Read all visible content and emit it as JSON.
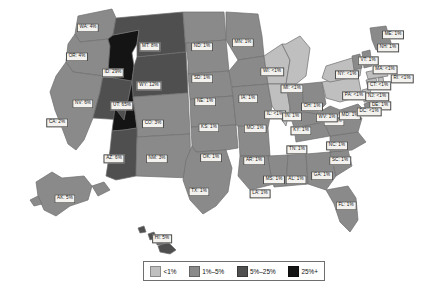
{
  "figure": {
    "type": "choropleth-map",
    "region": "United States",
    "background_color": "#ffffff"
  },
  "legend": {
    "name": "percent-range-legend",
    "position": "bottom-center",
    "entries": [
      {
        "label": "<1%",
        "color": "#bfbfbf"
      },
      {
        "label": "1%–5%",
        "color": "#8a8a8a"
      },
      {
        "label": "5%–25%",
        "color": "#4f4f4f"
      },
      {
        "label": "25%+",
        "color": "#141414"
      }
    ]
  },
  "colors": {
    "tier_lt1": "#bfbfbf",
    "tier_1_5": "#8a8a8a",
    "tier_5_25": "#4f4f4f",
    "tier_25plus": "#141414",
    "border": "#6e6e6e",
    "label_bg": "#f3f2ef",
    "label_border": "#4a4a4a",
    "label_text": "#141414"
  },
  "chart_data": {
    "type": "map",
    "title": "",
    "xlabel": "",
    "ylabel": "",
    "value_unit": "percent",
    "legend_position": "bottom-center",
    "bins": [
      "<1%",
      "1%–5%",
      "5%–25%",
      "25%+"
    ],
    "categories": [
      "WA",
      "OR",
      "CA",
      "NV",
      "ID",
      "MT",
      "WY",
      "UT",
      "CO",
      "AZ",
      "NM",
      "ND",
      "SD",
      "NE",
      "KS",
      "OK",
      "TX",
      "MN",
      "IA",
      "MO",
      "AR",
      "LA",
      "WI",
      "IL",
      "MI",
      "IN",
      "OH",
      "KY",
      "TN",
      "MS",
      "AL",
      "GA",
      "FL",
      "SC",
      "NC",
      "VA",
      "WV",
      "MD",
      "DE",
      "DC",
      "PA",
      "NJ",
      "NY",
      "CT",
      "RI",
      "MA",
      "VT",
      "NH",
      "ME",
      "AK",
      "HI"
    ],
    "values": [
      4,
      4,
      2,
      6,
      29,
      8,
      12,
      65,
      3,
      6,
      3,
      1,
      1,
      1,
      1,
      1,
      1,
      1,
      1,
      1,
      1,
      1,
      0.5,
      0.5,
      0.5,
      1,
      1,
      1,
      1,
      1,
      1,
      1,
      1,
      1,
      1,
      1,
      1,
      1,
      1,
      0.5,
      0.5,
      0.5,
      0.5,
      0.5,
      0.5,
      0.5,
      1,
      1,
      1,
      5,
      5
    ],
    "states": [
      {
        "code": "WA",
        "label": "WA: 4%",
        "value": 4,
        "tier": "tier_1_5",
        "lx": 88,
        "ly": 28
      },
      {
        "code": "OR",
        "label": "OR: 4%",
        "value": 4,
        "tier": "tier_1_5",
        "lx": 77,
        "ly": 57
      },
      {
        "code": "CA",
        "label": "CA: 2%",
        "value": 2,
        "tier": "tier_1_5",
        "lx": 57,
        "ly": 123
      },
      {
        "code": "NV",
        "label": "NV: 6%",
        "value": 6,
        "tier": "tier_5_25",
        "lx": 83,
        "ly": 104
      },
      {
        "code": "ID",
        "label": "ID: 29%",
        "value": 29,
        "tier": "tier_25plus",
        "lx": 113,
        "ly": 73
      },
      {
        "code": "MT",
        "label": "MT: 8%",
        "value": 8,
        "tier": "tier_5_25",
        "lx": 150,
        "ly": 47
      },
      {
        "code": "WY",
        "label": "WY: 12%",
        "value": 12,
        "tier": "tier_5_25",
        "lx": 149,
        "ly": 86
      },
      {
        "code": "UT",
        "label": "UT: 65%",
        "value": 65,
        "tier": "tier_25plus",
        "lx": 122,
        "ly": 106
      },
      {
        "code": "CO",
        "label": "CO: 3%",
        "value": 3,
        "tier": "tier_1_5",
        "lx": 153,
        "ly": 124
      },
      {
        "code": "AZ",
        "label": "AZ: 6%",
        "value": 6,
        "tier": "tier_5_25",
        "lx": 114,
        "ly": 159
      },
      {
        "code": "NM",
        "label": "NM: 3%",
        "value": 3,
        "tier": "tier_1_5",
        "lx": 157,
        "ly": 159
      },
      {
        "code": "ND",
        "label": "ND: 1%",
        "value": 1,
        "tier": "tier_1_5",
        "lx": 202,
        "ly": 47
      },
      {
        "code": "SD",
        "label": "SD: 1%",
        "value": 1,
        "tier": "tier_1_5",
        "lx": 202,
        "ly": 79
      },
      {
        "code": "NE",
        "label": "NE: 1%",
        "value": 1,
        "tier": "tier_1_5",
        "lx": 205,
        "ly": 102
      },
      {
        "code": "KS",
        "label": "KS: 1%",
        "value": 1,
        "tier": "tier_1_5",
        "lx": 209,
        "ly": 128
      },
      {
        "code": "OK",
        "label": "OK: 1%",
        "value": 1,
        "tier": "tier_1_5",
        "lx": 211,
        "ly": 158
      },
      {
        "code": "TX",
        "label": "TX: 1%",
        "value": 1,
        "tier": "tier_1_5",
        "lx": 199,
        "ly": 192
      },
      {
        "code": "MN",
        "label": "MN: 1%",
        "value": 1,
        "tier": "tier_1_5",
        "lx": 243,
        "ly": 43
      },
      {
        "code": "IA",
        "label": "IA: 1%",
        "value": 1,
        "tier": "tier_1_5",
        "lx": 248,
        "ly": 99
      },
      {
        "code": "MO",
        "label": "MO: 1%",
        "value": 1,
        "tier": "tier_1_5",
        "lx": 255,
        "ly": 129
      },
      {
        "code": "AR",
        "label": "AR: 1%",
        "value": 1,
        "tier": "tier_1_5",
        "lx": 254,
        "ly": 161
      },
      {
        "code": "LA",
        "label": "LA: 1%",
        "value": 1,
        "tier": "tier_1_5",
        "lx": 260,
        "ly": 194
      },
      {
        "code": "WI",
        "label": "WI: <1%",
        "value": 0.5,
        "tier": "tier_lt1",
        "lx": 272,
        "ly": 72
      },
      {
        "code": "IL",
        "label": "IL: <1%",
        "value": 0.5,
        "tier": "tier_lt1",
        "lx": 275,
        "ly": 115
      },
      {
        "code": "MI",
        "label": "MI: <1%",
        "value": 0.5,
        "tier": "tier_lt1",
        "lx": 292,
        "ly": 89
      },
      {
        "code": "IN",
        "label": "IN: 1%",
        "value": 1,
        "tier": "tier_1_5",
        "lx": 292,
        "ly": 117
      },
      {
        "code": "OH",
        "label": "OH: 1%",
        "value": 1,
        "tier": "tier_1_5",
        "lx": 312,
        "ly": 107
      },
      {
        "code": "KY",
        "label": "KY: 1%",
        "value": 1,
        "tier": "tier_1_5",
        "lx": 301,
        "ly": 131
      },
      {
        "code": "TN",
        "label": "TN: 1%",
        "value": 1,
        "tier": "tier_1_5",
        "lx": 297,
        "ly": 150
      },
      {
        "code": "MS",
        "label": "MS: 1%",
        "value": 1,
        "tier": "tier_1_5",
        "lx": 274,
        "ly": 180
      },
      {
        "code": "AL",
        "label": "AL: 1%",
        "value": 1,
        "tier": "tier_1_5",
        "lx": 296,
        "ly": 180
      },
      {
        "code": "GA",
        "label": "GA: 1%",
        "value": 1,
        "tier": "tier_1_5",
        "lx": 322,
        "ly": 176
      },
      {
        "code": "FL",
        "label": "FL: 1%",
        "value": 1,
        "tier": "tier_1_5",
        "lx": 346,
        "ly": 206
      },
      {
        "code": "SC",
        "label": "SC: 1%",
        "value": 1,
        "tier": "tier_1_5",
        "lx": 340,
        "ly": 161
      },
      {
        "code": "NC",
        "label": "NC: 1%",
        "value": 1,
        "tier": "tier_1_5",
        "lx": 337,
        "ly": 146
      },
      {
        "code": "VA",
        "label": "VA: 1%",
        "value": 1,
        "tier": "tier_1_5",
        "lx": 334,
        "ly": 122
      },
      {
        "code": "WV",
        "label": "WV: 1%",
        "value": 1,
        "tier": "tier_1_5",
        "lx": 327,
        "ly": 118
      },
      {
        "code": "MD",
        "label": "MD: 1%",
        "value": 1,
        "tier": "tier_1_5",
        "lx": 350,
        "ly": 116
      },
      {
        "code": "DE",
        "label": "DE: 1%",
        "value": 1,
        "tier": "tier_1_5",
        "lx": 380,
        "ly": 106
      },
      {
        "code": "DC",
        "label": "DC: <1%",
        "value": 0.5,
        "tier": "tier_lt1",
        "lx": 369,
        "ly": 112
      },
      {
        "code": "PA",
        "label": "PA: <1%",
        "value": 0.5,
        "tier": "tier_lt1",
        "lx": 354,
        "ly": 96
      },
      {
        "code": "NJ",
        "label": "NJ: <1%",
        "value": 0.5,
        "tier": "tier_lt1",
        "lx": 377,
        "ly": 97
      },
      {
        "code": "NY",
        "label": "NY: <1%",
        "value": 0.5,
        "tier": "tier_lt1",
        "lx": 347,
        "ly": 75
      },
      {
        "code": "CT",
        "label": "CT: <1%",
        "value": 0.5,
        "tier": "tier_lt1",
        "lx": 379,
        "ly": 86
      },
      {
        "code": "RI",
        "label": "RI: <1%",
        "value": 0.5,
        "tier": "tier_lt1",
        "lx": 402,
        "ly": 79
      },
      {
        "code": "MA",
        "label": "MA: <1%",
        "value": 0.5,
        "tier": "tier_lt1",
        "lx": 385,
        "ly": 70
      },
      {
        "code": "VT",
        "label": "VT: 1%",
        "value": 1,
        "tier": "tier_1_5",
        "lx": 368,
        "ly": 61
      },
      {
        "code": "NH",
        "label": "NH: 1%",
        "value": 1,
        "tier": "tier_1_5",
        "lx": 388,
        "ly": 48
      },
      {
        "code": "ME",
        "label": "ME: 1%",
        "value": 1,
        "tier": "tier_1_5",
        "lx": 393,
        "ly": 35
      },
      {
        "code": "AK",
        "label": "AK: 5%",
        "value": 5,
        "tier": "tier_1_5",
        "lx": 65,
        "ly": 199
      },
      {
        "code": "HI",
        "label": "HI: 5%",
        "value": 5,
        "tier": "tier_5_25",
        "lx": 162,
        "ly": 239
      }
    ]
  }
}
